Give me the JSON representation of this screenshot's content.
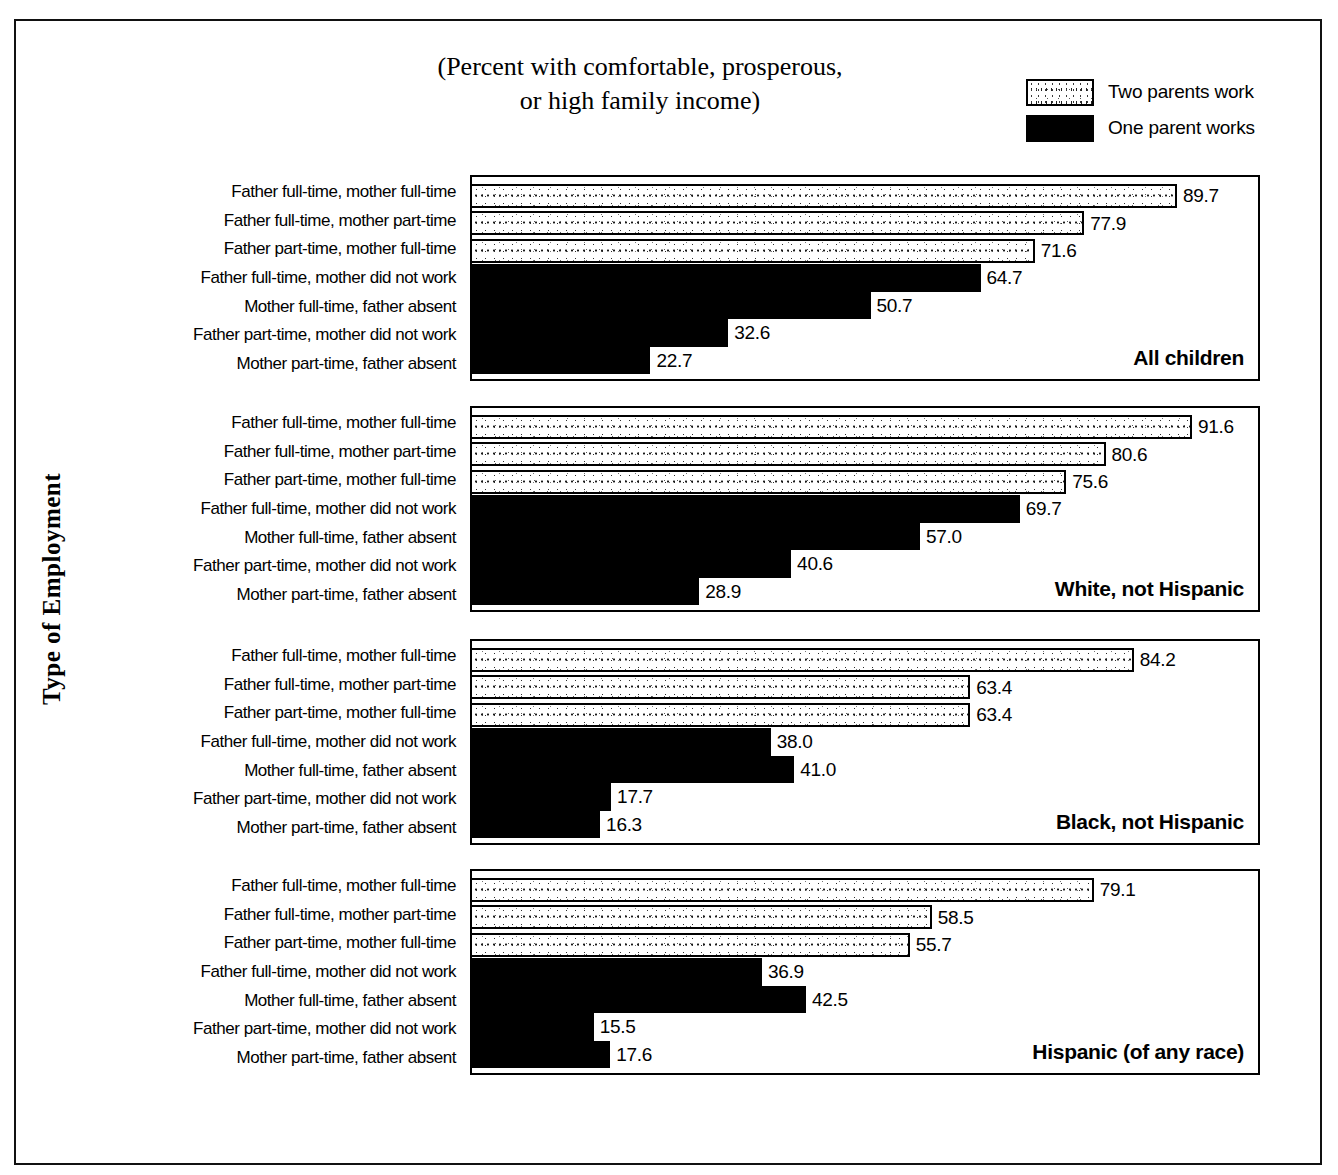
{
  "title": "(Percent with comfortable, prosperous,\nor high family income)",
  "y_axis_title": "Type of Employment",
  "legend": {
    "items": [
      {
        "label": "Two parents work",
        "swatch": "two-parents",
        "color": "#ffffff"
      },
      {
        "label": "One parent works",
        "swatch": "one-parent",
        "color": "#000000"
      }
    ]
  },
  "chart_data": {
    "type": "bar",
    "orientation": "horizontal",
    "title": "(Percent with comfortable, prosperous, or high family income)",
    "xlabel": "",
    "ylabel": "Type of Employment",
    "xlim": [
      0,
      100
    ],
    "grid": false,
    "legend_position": "top-right",
    "categories": [
      "Father full-time, mother full-time",
      "Father full-time, mother part-time",
      "Father part-time, mother full-time",
      "Father full-time, mother did not work",
      "Mother full-time, father absent",
      "Father part-time, mother did not work",
      "Mother part-time, father absent"
    ],
    "category_groups": [
      "Two parents work",
      "Two parents work",
      "Two parents work",
      "One parent works",
      "One parent works",
      "One parent works",
      "One parent works"
    ],
    "panels": [
      {
        "caption": "All children",
        "values": [
          89.7,
          77.9,
          71.6,
          64.7,
          50.7,
          32.6,
          22.7
        ],
        "value_labels": [
          "89.7",
          "77.9",
          "71.6",
          "64.7",
          "50.7",
          "32.6",
          "22.7"
        ]
      },
      {
        "caption": "White, not Hispanic",
        "values": [
          91.6,
          80.6,
          75.6,
          69.7,
          57.0,
          40.6,
          28.9
        ],
        "value_labels": [
          "91.6",
          "80.6",
          "75.6",
          "69.7",
          "57.0",
          "40.6",
          "28.9"
        ]
      },
      {
        "caption": "Black, not Hispanic",
        "values": [
          84.2,
          63.4,
          63.4,
          38.0,
          41.0,
          17.7,
          16.3
        ],
        "value_labels": [
          "84.2",
          "63.4",
          "63.4",
          "38.0",
          "41.0",
          "17.7",
          "16.3"
        ]
      },
      {
        "caption": "Hispanic (of any race)",
        "values": [
          79.1,
          58.5,
          55.7,
          36.9,
          42.5,
          15.5,
          17.6
        ],
        "value_labels": [
          "79.1",
          "58.5",
          "55.7",
          "36.9",
          "42.5",
          "15.5",
          "17.6"
        ]
      }
    ]
  }
}
